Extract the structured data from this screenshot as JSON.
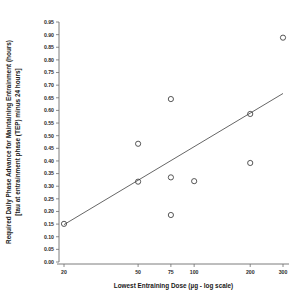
{
  "chart_data": {
    "type": "scatter",
    "title": "",
    "xlabel": "Lowest Entraining Dose (µg - log scale)",
    "ylabel_line1": "Required Daily Phase Advance for Maintaining Entrainment (hours)",
    "ylabel_line2": "[tau at entrainment phase (TEP) minus 24 hours]",
    "xscale": "log",
    "xlim": [
      18,
      330
    ],
    "ylim": [
      0.0,
      0.95
    ],
    "xticks": [
      20,
      50,
      75,
      100,
      200,
      300
    ],
    "xtick_labels": [
      "20",
      "50",
      "75",
      "100",
      "200",
      "300"
    ],
    "yticks": [
      0.0,
      0.05,
      0.1,
      0.15,
      0.2,
      0.25,
      0.3,
      0.35,
      0.4,
      0.45,
      0.5,
      0.55,
      0.6,
      0.65,
      0.7,
      0.75,
      0.8,
      0.85,
      0.9,
      0.95
    ],
    "ytick_labels": [
      "0.00",
      "0.05",
      "0.10",
      "0.15",
      "0.20",
      "0.25",
      "0.30",
      "0.35",
      "0.40",
      "0.45",
      "0.50",
      "0.55",
      "0.60",
      "0.65",
      "0.70",
      "0.75",
      "0.80",
      "0.85",
      "0.90",
      "0.95"
    ],
    "grid": false,
    "legend": "none",
    "marker": "open-circle",
    "marker_color": "#3a3a3a",
    "line_color": "#4a4a4a",
    "axis_color": "#6e6e6e",
    "points": [
      {
        "x": 20,
        "y": 0.151
      },
      {
        "x": 50,
        "y": 0.468
      },
      {
        "x": 50,
        "y": 0.318
      },
      {
        "x": 75,
        "y": 0.645
      },
      {
        "x": 75,
        "y": 0.335
      },
      {
        "x": 75,
        "y": 0.186
      },
      {
        "x": 100,
        "y": 0.32
      },
      {
        "x": 200,
        "y": 0.586
      },
      {
        "x": 200,
        "y": 0.392
      },
      {
        "x": 300,
        "y": 0.888
      }
    ],
    "fit_line": {
      "x_start": 20,
      "y_start": 0.148,
      "x_end": 300,
      "y_end": 0.667
    }
  }
}
